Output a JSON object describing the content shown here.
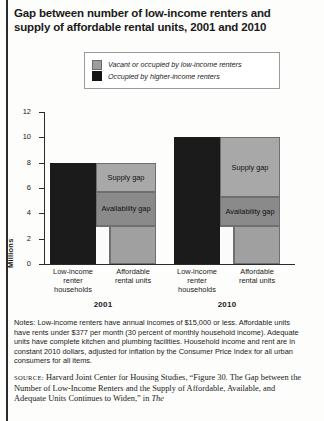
{
  "title": "Gap between number of low-income renters and supply of affordable rental units, 2001 and 2010",
  "legend": {
    "items": [
      {
        "label": "Vacant or occupied by low-income renters",
        "color": "#9c9c9c",
        "swatch": "gray-swatch"
      },
      {
        "label": "Occupied by higher-income renters",
        "color": "#141414",
        "swatch": "black-swatch"
      }
    ]
  },
  "notes": "Notes: Low-income renters have annual incomes of $15,000 or less. Affordable units have rents under $377 per month (30 percent of monthly household income). Adequate units have complete kitchen and plumbing facilities. Household income and rent are in constant 2010 dollars, adjusted for inflation by the Consumer Price Index for all urban consumers for all items.",
  "source": {
    "prefix": "SOURCE:",
    "body": " Harvard Joint Center for Housing Studies, “Figure 30. The Gap between the Number of Low-Income Renters and the Supply of Affordable, Available, and Adequate Units Continues to Widen,” in ",
    "italic_tail": "The"
  },
  "chart_data": {
    "type": "bar",
    "title": "Gap between number of low-income renters and supply of affordable rental units, 2001 and 2010",
    "xlabel": "",
    "ylabel": "Millions",
    "ylim": [
      0,
      12
    ],
    "yticks": [
      0,
      2,
      4,
      6,
      8,
      10,
      12
    ],
    "grid": false,
    "legend_position": "top-center",
    "groups": [
      {
        "year": "2001",
        "bars": [
          {
            "category": "Low-income renter households",
            "total": 8.0,
            "segments": [
              {
                "name": "Occupied by higher-income renters",
                "from": 0,
                "to": 8.0,
                "fill": "black",
                "label": ""
              }
            ]
          },
          {
            "category": "Affordable rental units",
            "total": 5.7,
            "segments": [
              {
                "name": "Vacant or occupied by low-income renters",
                "from": 0,
                "to": 3.0,
                "fill": "gray",
                "label": ""
              },
              {
                "name": "Occupied by higher-income renters",
                "from": 3.0,
                "to": 5.7,
                "fill": "black",
                "label": ""
              }
            ]
          }
        ],
        "annotations": [
          {
            "text": "Supply gap",
            "from": 5.7,
            "to": 8.0
          },
          {
            "text": "Availability gap",
            "from": 3.0,
            "to": 5.7
          }
        ]
      },
      {
        "year": "2010",
        "bars": [
          {
            "category": "Low-income renter households",
            "total": 10.0,
            "segments": [
              {
                "name": "Occupied by higher-income renters",
                "from": 0,
                "to": 10.0,
                "fill": "black",
                "label": ""
              }
            ]
          },
          {
            "category": "Affordable rental units",
            "total": 5.3,
            "segments": [
              {
                "name": "Vacant or occupied by low-income renters",
                "from": 0,
                "to": 3.0,
                "fill": "gray",
                "label": ""
              },
              {
                "name": "Occupied by higher-income renters",
                "from": 3.0,
                "to": 5.3,
                "fill": "black",
                "label": ""
              }
            ]
          }
        ],
        "annotations": [
          {
            "text": "Supply gap",
            "from": 5.3,
            "to": 10.0
          },
          {
            "text": "Availability gap",
            "from": 3.0,
            "to": 5.3
          }
        ]
      }
    ],
    "categories_display": [
      "Low-income renter households",
      "Affordable rental units",
      "Low-income renter households",
      "Affordable rental units"
    ],
    "annotation_labels": [
      "Supply gap",
      "Availability gap"
    ],
    "colors": {
      "gray": "#a0a0a0",
      "black": "#1b1b1b",
      "white": "#fbfbfb"
    }
  }
}
